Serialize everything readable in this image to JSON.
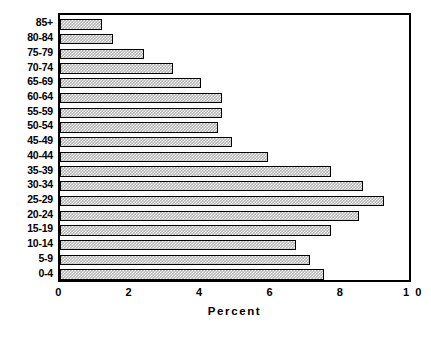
{
  "chart_data": {
    "type": "bar",
    "orientation": "horizontal",
    "title": "",
    "subtitle": "",
    "xlabel": "Percent",
    "ylabel": "",
    "xlim": [
      0,
      10
    ],
    "ylim": null,
    "grid": false,
    "legend": null,
    "legend_position": "none",
    "xticks": [
      "0",
      "2",
      "4",
      "6",
      "8",
      "1 0"
    ],
    "xtick_values": [
      0,
      2,
      4,
      6,
      8,
      10
    ],
    "categories": [
      "85+",
      "80-84",
      "75-79",
      "70-74",
      "65-69",
      "60-64",
      "55-59",
      "50-54",
      "45-49",
      "40-44",
      "35-39",
      "30-34",
      "25-29",
      "20-24",
      "15-19",
      "10-14",
      "5-9",
      "0-4"
    ],
    "values": [
      1.2,
      1.5,
      2.4,
      3.2,
      4.0,
      4.6,
      4.6,
      4.5,
      4.9,
      5.9,
      7.7,
      8.6,
      9.2,
      8.5,
      7.7,
      6.7,
      7.1,
      7.5
    ],
    "bar_fill": "#b3b3b3",
    "bar_pattern": "checkerboard-hatch",
    "bar_border": "#000000",
    "frame_color": "#000000",
    "background": "#ffffff"
  }
}
